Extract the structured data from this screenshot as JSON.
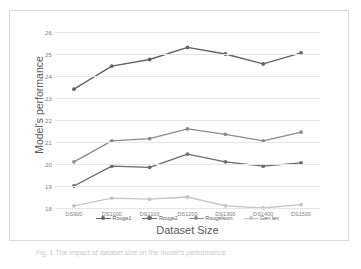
{
  "figure": {
    "caption": "Fig. 1  The impact of dataset size on the model's performance"
  },
  "chart_data": {
    "type": "line",
    "title": "",
    "xlabel": "Dataset Size",
    "ylabel": "Model's performance",
    "categories": [
      "DS900",
      "DS1000",
      "DS1100",
      "DS1200",
      "DS1300",
      "DS1400",
      "DS1500"
    ],
    "ylim": [
      18,
      26
    ],
    "yticks": [
      18,
      19,
      20,
      21,
      22,
      23,
      24,
      25,
      26
    ],
    "ytick_labels": [
      "18",
      "19",
      "20",
      "21",
      "22",
      "23",
      "24",
      "25",
      "26"
    ],
    "grid": "horizontal",
    "legend_position": "bottom",
    "series": [
      {
        "name": "Rouge1",
        "color": "#636363",
        "marker": "circle",
        "values": [
          23.4,
          24.45,
          24.75,
          25.3,
          25.0,
          24.55,
          25.05
        ]
      },
      {
        "name": "Rouge2",
        "color": "#6b6b6b",
        "marker": "circle",
        "values": [
          19.0,
          19.9,
          19.85,
          20.45,
          20.1,
          19.9,
          20.05
        ]
      },
      {
        "name": "Rougelsum",
        "color": "#8c8c8c",
        "marker": "circle",
        "values": [
          20.1,
          21.05,
          21.15,
          21.6,
          21.35,
          21.05,
          21.45
        ]
      },
      {
        "name": "Gen len",
        "color": "#c4c4c4",
        "marker": "circle",
        "values": [
          18.1,
          18.45,
          18.4,
          18.5,
          18.1,
          18.0,
          18.15
        ]
      }
    ]
  },
  "colors": {
    "gridline": "#e6e6e6",
    "frame_border": "#d9d9d9",
    "axis_text": "#7f7f7f",
    "title_text": "#595959",
    "background": "#ffffff"
  }
}
